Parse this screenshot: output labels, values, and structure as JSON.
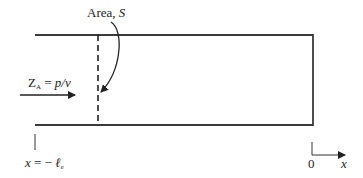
{
  "diagram": {
    "area_label": {
      "text": "Area, ",
      "symbol": "S"
    },
    "impedance_label": {
      "lhs": "Z",
      "subscript": "A",
      "eq": " = ",
      "rhs": "p/v"
    },
    "position_label": {
      "var": "x",
      "eq": " = − ",
      "sym": "ℓ",
      "subscript": "e"
    },
    "axis": {
      "origin": "0",
      "var": "x"
    },
    "colors": {
      "line": "#3a3a3a",
      "text": "#222222"
    }
  }
}
